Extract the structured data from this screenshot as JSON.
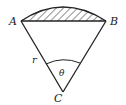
{
  "diagram": {
    "type": "circular-sector",
    "points": {
      "A": {
        "label": "A"
      },
      "B": {
        "label": "B"
      },
      "C": {
        "label": "C"
      }
    },
    "radius_label": "r",
    "angle_label": "θ",
    "shaded_region": "circular segment between chord AB and arc AB",
    "colors": {
      "stroke": "#222222",
      "background": "#ffffff"
    }
  }
}
